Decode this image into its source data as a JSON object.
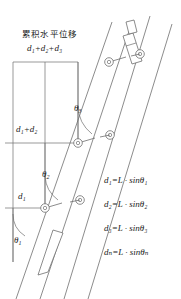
{
  "figure": {
    "type": "engineering-diagram",
    "title_cn": "累积水平位移",
    "title_sum": "d₁+d₂+d₃",
    "background_color": "#ffffff",
    "line_color": "#6e6e6e",
    "text_color": "#1a1a1a"
  },
  "labels": {
    "cumulative_top": "d₁+d₂+d₃",
    "level_two": "d₁+d₂",
    "level_one": "d₁"
  },
  "angles": [
    {
      "name": "theta-1",
      "label": "θ",
      "sub": "1"
    },
    {
      "name": "theta-2",
      "label": "θ",
      "sub": "2"
    },
    {
      "name": "theta-3",
      "label": "θ",
      "sub": "3"
    }
  ],
  "formulas": [
    {
      "lhs": "d",
      "lhs_sub": "1",
      "eq": "=",
      "rhs_head": "L",
      "dot": "·",
      "fn": "sin",
      "angle": "θ",
      "angle_sub": "1"
    },
    {
      "lhs": "d",
      "lhs_sub": "2",
      "eq": "=",
      "rhs_head": "L",
      "dot": "·",
      "fn": "sin",
      "angle": "θ",
      "angle_sub": "2"
    },
    {
      "lhs": "d",
      "lhs_sub": "3",
      "eq": "=",
      "rhs_head": "L",
      "dot": "·",
      "fn": "sin",
      "angle": "θ",
      "angle_sub": "3"
    },
    {
      "lhs": "d",
      "lhs_sub": "n",
      "eq": "=",
      "rhs_head": "L",
      "dot": "·",
      "fn": "sin",
      "angle": "θ",
      "angle_sub": "n"
    }
  ],
  "formula_text": [
    "d₁=L · sinθ₁",
    "d₂=L · sinθ₂",
    "d₃=L · sinθ₃",
    "dₙ=L · sinθₙ"
  ],
  "geometry": {
    "probe_count": 1,
    "wheel_count": 6,
    "casing_lines": 4,
    "reference_vertical_x": 13,
    "grid_horizontals_y": [
      62,
      143,
      208
    ],
    "grid_verticals_x": [
      13,
      45,
      78
    ]
  }
}
